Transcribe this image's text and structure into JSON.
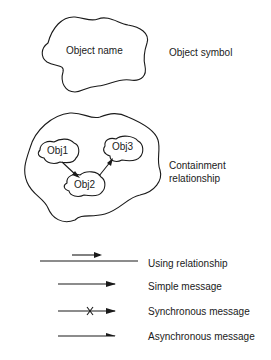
{
  "object_symbol": {
    "inner_label": "Object name",
    "caption": "Object symbol"
  },
  "containment": {
    "objects": [
      "Obj1",
      "Obj2",
      "Obj3"
    ],
    "caption_line1": "Containment",
    "caption_line2": "relationship"
  },
  "legend": [
    {
      "type": "using",
      "label": "Using relationship"
    },
    {
      "type": "simple",
      "label": "Simple message"
    },
    {
      "type": "synchronous",
      "label": "Synchronous message"
    },
    {
      "type": "asynchronous",
      "label": "Asynchronous message"
    }
  ]
}
